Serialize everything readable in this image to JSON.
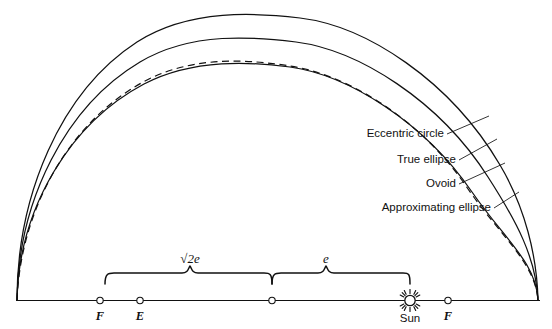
{
  "figure": {
    "background_color": "#ffffff",
    "ink_color": "#111111",
    "width": 552,
    "height": 329
  },
  "curve_labels": [
    {
      "id": "eccentric-circle",
      "text": "Eccentric circle",
      "style": "solid"
    },
    {
      "id": "true-ellipse",
      "text": "True ellipse",
      "style": "solid"
    },
    {
      "id": "ovoid",
      "text": "Ovoid",
      "style": "solid"
    },
    {
      "id": "approximating-ellipse",
      "text": "Approximating ellipse",
      "style": "dashed"
    }
  ],
  "axis": {
    "points": [
      {
        "id": "focus-left",
        "label": "F"
      },
      {
        "id": "equant",
        "label": "E"
      },
      {
        "id": "center",
        "label": ""
      },
      {
        "id": "sun",
        "label": "Sun"
      },
      {
        "id": "focus-right",
        "label": "F"
      }
    ]
  },
  "measurements": [
    {
      "id": "sqrt-2e",
      "radical": "√",
      "value": "2e",
      "full_text": "√2e"
    },
    {
      "id": "e",
      "radical": "",
      "value": "e",
      "full_text": "e"
    }
  ]
}
